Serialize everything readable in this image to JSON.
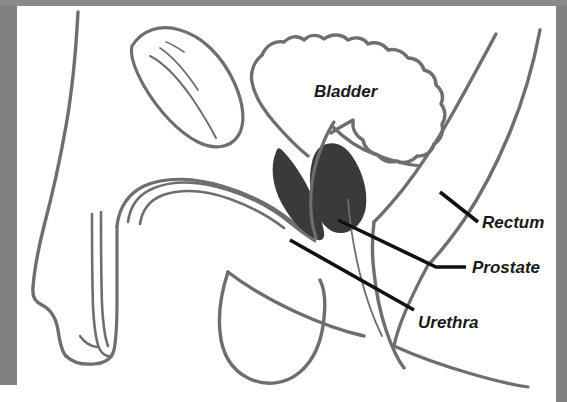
{
  "figure": {
    "background_color": "#ffffff",
    "border_color": "#808080",
    "anatomy_stroke_color": "#6e6e6e",
    "prostate_fill_color": "#3a3a3a",
    "leader_line_color": "#111111",
    "label_text_color": "#1a1a1a"
  },
  "labels": {
    "bladder": "Bladder",
    "rectum": "Rectum",
    "prostate": "Prostate",
    "urethra": "Urethra"
  },
  "icons": {
    "bladder_region": "bladder-outline-icon",
    "prostate_region": "prostate-filled-icon",
    "rectum_region": "rectum-curve-icon",
    "urethra_region": "urethra-channel-icon",
    "penis_region": "penis-outline-icon",
    "scrotum_region": "scrotum-outline-icon",
    "abdomen_region": "abdomen-oval-icon",
    "body_contour": "body-contour-icon"
  }
}
